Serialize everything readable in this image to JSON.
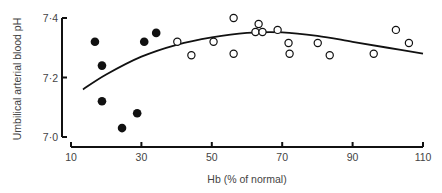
{
  "chart_data": {
    "type": "scatter",
    "title": "",
    "xlabel": "Hb (% of normal)",
    "ylabel": "Umbilical arterial blood pH",
    "xlim": [
      10,
      110
    ],
    "ylim": [
      7.0,
      7.4
    ],
    "x_ticks": [
      10,
      30,
      50,
      70,
      90,
      110
    ],
    "x_tick_labels": [
      "10",
      "30",
      "50",
      "70",
      "90",
      "110"
    ],
    "y_ticks": [
      7.0,
      7.2,
      7.4
    ],
    "y_tick_labels": [
      "7·0",
      "7·2",
      "7·4"
    ],
    "grid": false,
    "legend": null,
    "series": [
      {
        "name": "filled",
        "marker": "filled-circle",
        "points": [
          [
            16.8,
            7.32
          ],
          [
            18.8,
            7.24
          ],
          [
            18.8,
            7.12
          ],
          [
            24.5,
            7.03
          ],
          [
            28.8,
            7.08
          ],
          [
            30.8,
            7.32
          ],
          [
            34.2,
            7.35
          ]
        ]
      },
      {
        "name": "open",
        "marker": "open-circle",
        "points": [
          [
            40.2,
            7.32
          ],
          [
            44.2,
            7.275
          ],
          [
            50.5,
            7.32
          ],
          [
            56.2,
            7.4
          ],
          [
            56.2,
            7.28
          ],
          [
            62.4,
            7.353
          ],
          [
            63.3,
            7.38
          ],
          [
            64.4,
            7.353
          ],
          [
            68.7,
            7.36
          ],
          [
            71.8,
            7.316
          ],
          [
            72.1,
            7.28
          ],
          [
            80.1,
            7.316
          ],
          [
            83.5,
            7.275
          ],
          [
            96.0,
            7.28
          ],
          [
            102.3,
            7.36
          ],
          [
            106.0,
            7.316
          ]
        ]
      },
      {
        "name": "fitted curve",
        "type": "line",
        "points": [
          [
            13.4,
            7.16
          ],
          [
            20,
            7.21
          ],
          [
            30,
            7.27
          ],
          [
            40,
            7.31
          ],
          [
            50,
            7.335
          ],
          [
            60,
            7.35
          ],
          [
            70,
            7.352
          ],
          [
            80,
            7.34
          ],
          [
            90,
            7.32
          ],
          [
            100,
            7.3
          ],
          [
            110,
            7.28
          ]
        ]
      }
    ]
  }
}
